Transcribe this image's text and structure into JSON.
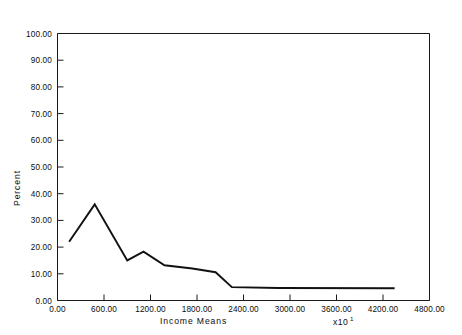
{
  "chart_data": {
    "type": "line",
    "title": "",
    "xlabel": "Income Means",
    "ylabel": "Percent",
    "x_multiplier": "x10",
    "x_multiplier_exponent": "1",
    "xlim": [
      0,
      4800
    ],
    "ylim": [
      0,
      100
    ],
    "grid": false,
    "legend": null,
    "x_tick_labels": [
      "0.00",
      "600.00",
      "1200.00",
      "1800.00",
      "2400.00",
      "3000.00",
      "3600.00",
      "4200.00",
      "4800.00"
    ],
    "x_tick_values": [
      0,
      600,
      1200,
      1800,
      2400,
      3000,
      3600,
      4200,
      4800
    ],
    "y_tick_labels": [
      "0.00",
      "10.00",
      "20.00",
      "30.00",
      "40.00",
      "50.00",
      "60.00",
      "70.00",
      "80.00",
      "90.00",
      "100.00"
    ],
    "y_tick_values": [
      0,
      10,
      20,
      30,
      40,
      50,
      60,
      70,
      80,
      90,
      100
    ],
    "series": [
      {
        "name": "Percent",
        "x": [
          150,
          480,
          900,
          1110,
          1380,
          1740,
          2040,
          2250,
          2850,
          4350
        ],
        "y": [
          22.0,
          36.0,
          15.0,
          18.3,
          13.2,
          12.0,
          10.6,
          5.0,
          4.7,
          4.6
        ]
      }
    ]
  }
}
